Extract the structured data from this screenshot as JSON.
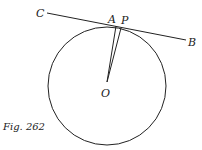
{
  "figure": {
    "caption": "Fig. 262",
    "labels": {
      "C": "C",
      "A": "A",
      "P": "P",
      "B": "B",
      "O": "O"
    },
    "circle": {
      "cx": 107,
      "cy": 86,
      "r": 59
    },
    "tangent_line": {
      "from": [
        47,
        13
      ],
      "to": [
        186,
        40
      ]
    },
    "radius_OA": {
      "from": [
        107,
        82
      ],
      "to": [
        116,
        26
      ]
    },
    "segment_OP": {
      "from": [
        107,
        82
      ],
      "to": [
        121,
        28
      ]
    },
    "stroke_color": "#222222"
  }
}
